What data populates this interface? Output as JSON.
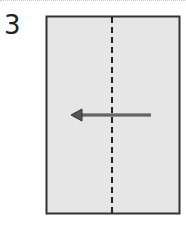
{
  "step": {
    "number": "3"
  },
  "diagram": {
    "paper_fill": "#e6e6e6",
    "paper_border": "#333333",
    "fold_line": {
      "type": "valley-fold",
      "style": "dashed",
      "color": "#222222"
    },
    "arrow": {
      "direction": "left",
      "color": "#555555",
      "meaning": "fold right half over to left"
    }
  }
}
